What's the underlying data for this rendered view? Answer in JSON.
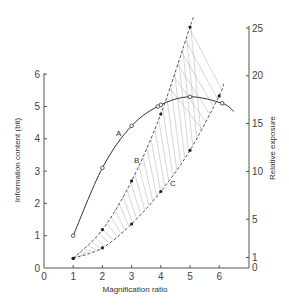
{
  "chart_data": {
    "type": "line",
    "title": "",
    "xlabel": "Magnification ratio",
    "ylabel_left": "Information content (bit)",
    "ylabel_right": "Relative exposure",
    "xlim": [
      0,
      6.8
    ],
    "ylim_left": [
      0,
      6
    ],
    "ylim_right": [
      0,
      25
    ],
    "x_ticks": [
      0,
      1,
      2,
      3,
      4,
      5,
      6
    ],
    "y_ticks_left": [
      0,
      1,
      2,
      3,
      4,
      5,
      6
    ],
    "y_ticks_right": [
      0,
      1,
      5,
      10,
      15,
      20,
      25
    ],
    "grid": false,
    "legend": "none (curves labelled inline A, B, C)",
    "series": [
      {
        "name": "A",
        "axis": "left",
        "style": "solid line, open circles",
        "x": [
          1,
          2,
          3,
          4,
          5,
          6.1
        ],
        "values": [
          1.0,
          3.1,
          4.4,
          5.05,
          5.3,
          5.1
        ],
        "curve_extends_to": [
          6.5,
          4.85
        ]
      },
      {
        "name": "B",
        "axis": "right",
        "style": "dashed line, filled dots",
        "x": [
          1,
          2,
          3,
          4,
          5
        ],
        "values": [
          0.9,
          3.9,
          9.0,
          16.0,
          25.1
        ]
      },
      {
        "name": "C",
        "axis": "right",
        "style": "dashed line, filled dots",
        "x": [
          1,
          2,
          3,
          4,
          5,
          6
        ],
        "values": [
          0.9,
          2.0,
          4.5,
          7.9,
          12.2,
          17.9
        ]
      }
    ],
    "annotations": [
      "Hatched region between curves B and C",
      "Open circles on curve A where it intersects B (x≈3.9) and C (x≈6.1)"
    ]
  },
  "labels": {
    "xlabel": "Magnification ratio",
    "ylabel_left": "Information content (bit)",
    "ylabel_right": "Relative exposure",
    "curve_a": "A",
    "curve_b": "B",
    "curve_c": "C"
  }
}
